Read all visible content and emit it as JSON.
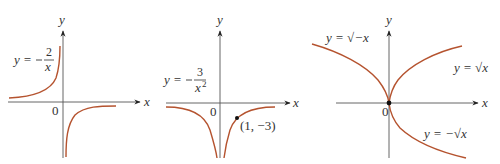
{
  "figures": [
    {
      "name": "graph-neg-2-over-x",
      "equation_lhs": "y =",
      "equation_sign": "−",
      "numerator": "2",
      "denominator": "x",
      "x_axis_label": "x",
      "y_axis_label": "y",
      "origin_label": "0"
    },
    {
      "name": "graph-neg-3-over-x2",
      "equation_lhs": "y =",
      "equation_sign": "−",
      "numerator": "3",
      "denominator": "x",
      "denominator_exp": "2",
      "x_axis_label": "x",
      "y_axis_label": "y",
      "origin_label": "0",
      "point_label": "(1, −3)"
    },
    {
      "name": "graph-square-roots",
      "x_axis_label": "x",
      "y_axis_label": "y",
      "origin_label": "0",
      "labels": {
        "sqrt_neg_x": "y = √−x",
        "sqrt_x": "y = √x",
        "neg_sqrt_x": "y = −√x"
      }
    }
  ],
  "colors": {
    "curve": "#b5532f",
    "axis": "#555555"
  }
}
